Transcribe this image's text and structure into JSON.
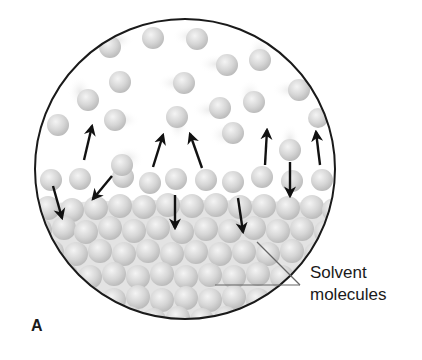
{
  "figure": {
    "panel_label": "A",
    "callout": {
      "line1": "Solvent",
      "line2": "molecules"
    },
    "circle": {
      "cx": 185,
      "cy": 169,
      "r": 151,
      "stroke": "#1a1a1a"
    },
    "colors": {
      "molecule_fill": "#d9d9d9",
      "molecule_highlight": "#f2f2f2",
      "molecule_shadow": "#bdbdbd",
      "arrow": "#111111",
      "leader_line": "#666666"
    }
  }
}
